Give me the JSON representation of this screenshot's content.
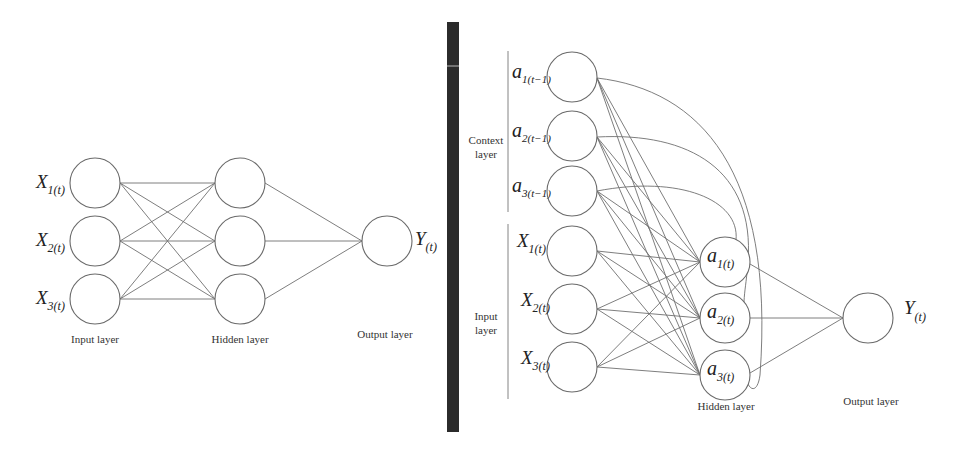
{
  "left_network": {
    "title": "Feedforward neural network",
    "input_labels": [
      {
        "symbol": "X",
        "subscript": "1(t)"
      },
      {
        "symbol": "X",
        "subscript": "2(t)"
      },
      {
        "symbol": "X",
        "subscript": "3(t)"
      }
    ],
    "output_label": {
      "symbol": "Y",
      "subscript": "(t)"
    },
    "layer_labels": {
      "input": "Input layer",
      "hidden": "Hidden layer",
      "output": "Output layer"
    },
    "nodes": {
      "input": [
        [
          95,
          183
        ],
        [
          95,
          241
        ],
        [
          95,
          299
        ]
      ],
      "hidden": [
        [
          240,
          183
        ],
        [
          240,
          241
        ],
        [
          240,
          299
        ]
      ],
      "output": [
        [
          387,
          241
        ]
      ],
      "radius": 25
    }
  },
  "right_network": {
    "title": "Recurrent (Elman) neural network",
    "context_labels": [
      {
        "symbol": "a",
        "subscript": "1(t−1)"
      },
      {
        "symbol": "a",
        "subscript": "2(t−1)"
      },
      {
        "symbol": "a",
        "subscript": "3(t−1)"
      }
    ],
    "input_labels": [
      {
        "symbol": "X",
        "subscript": "1(t)"
      },
      {
        "symbol": "X",
        "subscript": "2(t)"
      },
      {
        "symbol": "X",
        "subscript": "3(t)"
      }
    ],
    "hidden_labels": [
      {
        "symbol": "a",
        "subscript": "1(t)"
      },
      {
        "symbol": "a",
        "subscript": "2(t)"
      },
      {
        "symbol": "a",
        "subscript": "3(t)"
      }
    ],
    "output_label": {
      "symbol": "Y",
      "subscript": "(t)"
    },
    "group_labels": {
      "context_line1": "Context",
      "context_line2": "layer",
      "input_line1": "Input",
      "input_line2": "layer"
    },
    "layer_labels": {
      "hidden": "Hidden layer",
      "output": "Output layer"
    },
    "nodes": {
      "context": [
        [
          572,
          77
        ],
        [
          572,
          136
        ],
        [
          572,
          191
        ]
      ],
      "input": [
        [
          572,
          251
        ],
        [
          572,
          309
        ],
        [
          572,
          367
        ]
      ],
      "hidden": [
        [
          725,
          262
        ],
        [
          725,
          318
        ],
        [
          725,
          375
        ]
      ],
      "output": [
        [
          868,
          318
        ]
      ],
      "radius": 25
    }
  },
  "colors": {
    "divider": "#2b2b2b",
    "node_stroke": "#6a6a6a",
    "edge": "#6f6f6f",
    "text": "#222222"
  }
}
